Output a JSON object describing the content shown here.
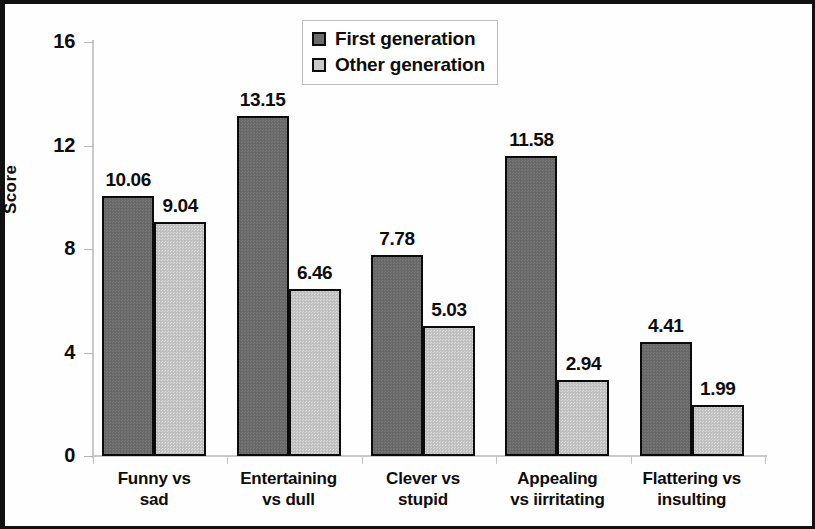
{
  "chart_data": {
    "type": "bar",
    "title": "",
    "xlabel": "",
    "ylabel": "Score",
    "ylim": [
      0,
      16
    ],
    "yticks": [
      0,
      4,
      8,
      12,
      16
    ],
    "ytick_labels": [
      "0",
      "4",
      "8",
      "12",
      "16"
    ],
    "grid": false,
    "legend_position": "upper center",
    "categories": [
      "Funny vs sad",
      "Entertaining vs dull",
      "Clever vs stupid",
      "Appealing vs iirritating",
      "Flattering vs insulting"
    ],
    "category_lines": [
      [
        "Funny vs",
        "sad"
      ],
      [
        "Entertaining",
        "vs dull"
      ],
      [
        "Clever vs",
        "stupid"
      ],
      [
        "Appealing",
        "vs iirritating"
      ],
      [
        "Flattering vs",
        "insulting"
      ]
    ],
    "series": [
      {
        "name": "First generation",
        "color": "#6b6b6b",
        "values": [
          10.06,
          13.15,
          7.78,
          11.58,
          4.41
        ],
        "labels": [
          "10.06",
          "13.15",
          "7.78",
          "11.58",
          "4.41"
        ]
      },
      {
        "name": "Other generation",
        "color": "#c3c3c3",
        "values": [
          9.04,
          6.46,
          5.03,
          2.94,
          1.99
        ],
        "labels": [
          "9.04",
          "6.46",
          "5.03",
          "2.94",
          "1.99"
        ]
      }
    ]
  },
  "legend": {
    "items": [
      {
        "label": "First generation",
        "swatch": "first"
      },
      {
        "label": "Other generation",
        "swatch": "other"
      }
    ]
  },
  "axis": {
    "y_title": "Score"
  }
}
